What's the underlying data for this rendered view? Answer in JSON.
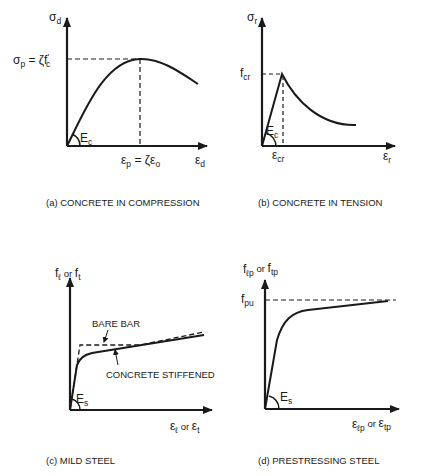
{
  "figure": {
    "panels": [
      {
        "id": "a",
        "caption": "(a)  CONCRETE IN COMPRESSION",
        "y_axis": {
          "symbol": "σ",
          "sub": "d"
        },
        "x_axis": {
          "symbol": "ε",
          "sub": "d"
        },
        "peak_stress_label": {
          "lhs": "σ",
          "lhs_sub": "p",
          "eq": " = ζf",
          "eq_sub": "c",
          "prime": "'"
        },
        "peak_strain_label": {
          "lhs": "ε",
          "lhs_sub": "p",
          "eq": " = ζε",
          "eq_sub": "o"
        },
        "modulus_label": {
          "symbol": "E",
          "sub": "c"
        }
      },
      {
        "id": "b",
        "caption": "(b)  CONCRETE IN TENSION",
        "y_axis": {
          "symbol": "σ",
          "sub": "r"
        },
        "x_axis": {
          "symbol": "ε",
          "sub": "r"
        },
        "crack_stress_label": {
          "symbol": "f",
          "sub": "cr"
        },
        "crack_strain_label": {
          "symbol": "ε",
          "sub": "cr"
        },
        "modulus_label": {
          "symbol": "E",
          "sub": "c"
        }
      },
      {
        "id": "c",
        "caption": "(c)  MILD STEEL",
        "y_axis": {
          "a": "f",
          "a_sub": "ℓ",
          "or": " or ",
          "b": "f",
          "b_sub": "t"
        },
        "x_axis": {
          "a": "ε",
          "a_sub": "ℓ",
          "or": " or ",
          "b": "ε",
          "b_sub": "t"
        },
        "curve_labels": {
          "bare": "BARE BAR",
          "stiffened": "CONCRETE STIFFENED"
        },
        "modulus_label": {
          "symbol": "E",
          "sub": "s"
        }
      },
      {
        "id": "d",
        "caption": "(d)  PRESTRESSING STEEL",
        "y_axis": {
          "a": "f",
          "a_sub": "ℓp",
          "or": " or ",
          "b": "f",
          "b_sub": "tp"
        },
        "x_axis": {
          "a": "ε",
          "a_sub": "ℓp",
          "or": " or ",
          "b": "ε",
          "b_sub": "tp"
        },
        "ultimate_label": {
          "symbol": "f",
          "sub": "pu"
        },
        "modulus_label": {
          "symbol": "E",
          "sub": "s"
        }
      }
    ]
  },
  "colors": {
    "ink": "#1a1a1a",
    "background": "#ffffff"
  }
}
